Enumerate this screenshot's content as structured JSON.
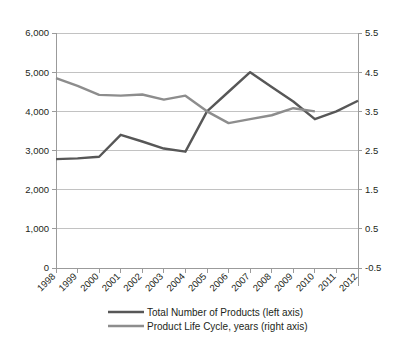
{
  "chart_data": {
    "type": "line",
    "title": "",
    "subtitle": "",
    "xlabel": "",
    "ylabel": "",
    "grid": true,
    "legend_position": "bottom",
    "categories": [
      "1998",
      "1999",
      "2000",
      "2001",
      "2002",
      "2003",
      "2004",
      "2005",
      "2006",
      "2007",
      "2008",
      "2009",
      "2010",
      "2011",
      "2012"
    ],
    "axes": {
      "left": {
        "label": "",
        "ylim": [
          0,
          6000
        ],
        "ticks": [
          0,
          1000,
          2000,
          3000,
          4000,
          5000,
          6000
        ],
        "tick_labels": [
          "0",
          "1,000",
          "2,000",
          "3,000",
          "4,000",
          "5,000",
          "6,000"
        ]
      },
      "right": {
        "label": "",
        "ylim": [
          -0.5,
          5.5
        ],
        "ticks": [
          -0.5,
          0.5,
          1.5,
          2.5,
          3.5,
          4.5,
          5.5
        ],
        "tick_labels": [
          "-0.5",
          "0.5",
          "1.5",
          "2.5",
          "3.5",
          "4.5",
          "5.5"
        ]
      }
    },
    "series": [
      {
        "name": "Total Number of Products (left axis)",
        "axis": "left",
        "color": "#575757",
        "width": 2.4,
        "x": [
          "1998",
          "1999",
          "2000",
          "2001",
          "2002",
          "2003",
          "2004",
          "2005",
          "2006",
          "2007",
          "2008",
          "2009",
          "2010",
          "2011",
          "2012"
        ],
        "values": [
          2780,
          2800,
          2840,
          3400,
          3230,
          3050,
          2970,
          4000,
          4500,
          5000,
          4620,
          4250,
          3800,
          4000,
          4270
        ]
      },
      {
        "name": "Product Life Cycle, years (right axis)",
        "axis": "right",
        "color": "#8d8d8d",
        "width": 2.4,
        "x": [
          "1998",
          "1999",
          "2000",
          "2001",
          "2002",
          "2003",
          "2004",
          "2005",
          "2006",
          "2007",
          "2008",
          "2009",
          "2010"
        ],
        "values": [
          4.35,
          4.15,
          3.92,
          3.9,
          3.93,
          3.8,
          3.9,
          3.5,
          3.2,
          3.3,
          3.4,
          3.58,
          3.5
        ]
      }
    ],
    "legend": [
      {
        "label": "Total Number of Products (left axis)",
        "color": "#575757"
      },
      {
        "label": "Product Life Cycle, years (right axis)",
        "color": "#8d8d8d"
      }
    ]
  }
}
